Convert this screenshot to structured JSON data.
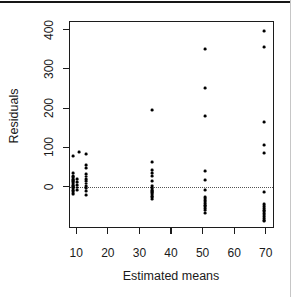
{
  "decor": {
    "top_rule_color": "#161616",
    "right_rule_color": "#c6c6c6",
    "plot_border_color": "#1c1c1c",
    "zero_line_color": "#555555",
    "marker_color": "#000000",
    "text_color": "#1a1a1a",
    "background": "#ffffff"
  },
  "chart_data": {
    "type": "scatter",
    "title": "",
    "xlabel": "Estimated means",
    "ylabel": "Residuals",
    "xlim": [
      7.55,
      72.6
    ],
    "ylim": [
      -105,
      423
    ],
    "x_ticks": [
      10,
      20,
      30,
      40,
      50,
      60,
      70
    ],
    "y_ticks": [
      0,
      100,
      200,
      300,
      400
    ],
    "grid": false,
    "legend": false,
    "zero_line_y": 0,
    "marker": {
      "shape": "filled-dot",
      "color": "#000000",
      "size_px": 2.8
    },
    "series": [
      {
        "name": "mean-9",
        "x": 9.1,
        "values": [
          78,
          35,
          28,
          24,
          20,
          17,
          14,
          11,
          8,
          5,
          2,
          0,
          -2,
          -5,
          -8,
          -12,
          -16,
          -20
        ]
      },
      {
        "name": "mean-10",
        "x": 10.3,
        "values": [
          20,
          12,
          5,
          -2,
          -9
        ]
      },
      {
        "name": "mean-11",
        "x": 11.0,
        "values": [
          88
        ]
      },
      {
        "name": "mean-13",
        "x": 13.2,
        "values": [
          83,
          55,
          47,
          32,
          26,
          20,
          14,
          8,
          2,
          -4,
          -11,
          -22
        ]
      },
      {
        "name": "mean-34",
        "x": 34.0,
        "values": [
          195,
          63,
          43,
          35,
          27,
          15,
          3,
          -1,
          -5,
          -8,
          -11,
          -14,
          -17,
          -20,
          -23,
          -27,
          -31
        ]
      },
      {
        "name": "mean-51",
        "x": 50.9,
        "values": [
          350,
          250,
          180,
          40,
          17,
          -8,
          -26,
          -30,
          -34,
          -38,
          -42,
          -46,
          -50,
          -55,
          -60,
          -67
        ]
      },
      {
        "name": "mean-69",
        "x": 69.5,
        "values": [
          397,
          355,
          165,
          105,
          85,
          -13,
          -45,
          -50,
          -55,
          -59,
          -63,
          -67,
          -71,
          -75,
          -79,
          -84,
          -88
        ]
      }
    ]
  }
}
